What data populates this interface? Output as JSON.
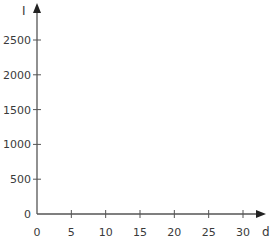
{
  "chart_data": {
    "type": "line",
    "title": "",
    "xlabel": "d",
    "ylabel": "I",
    "xlim": [
      0,
      30
    ],
    "ylim": [
      0,
      2500
    ],
    "xticks": [
      0,
      5,
      10,
      15,
      20,
      25,
      30
    ],
    "yticks": [
      0,
      500,
      1000,
      1500,
      2000,
      2500
    ],
    "series": [],
    "grid": false,
    "legend": null
  },
  "axes": {
    "x_label": "d",
    "y_label": "I",
    "x_tick_labels": [
      "0",
      "5",
      "10",
      "15",
      "20",
      "25",
      "30"
    ],
    "y_tick_labels": [
      "0",
      "500",
      "1000",
      "1500",
      "2000",
      "2500"
    ]
  },
  "colors": {
    "axis": "#555555",
    "text": "#3a3a3a"
  }
}
